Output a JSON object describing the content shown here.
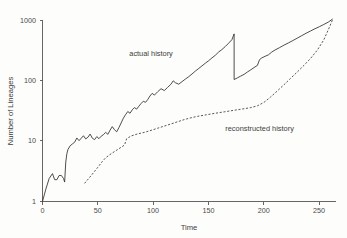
{
  "chart_data": {
    "type": "line",
    "title": "",
    "xlabel": "Time",
    "ylabel": "Number of Lineages",
    "yscale": "log",
    "xlim": [
      0,
      265
    ],
    "ylim": [
      1,
      1300
    ],
    "grid": false,
    "legend_position": "inline-annotations",
    "xticks": [
      0,
      50,
      100,
      150,
      200,
      250
    ],
    "xtick_labels": [
      "0",
      "50",
      "100",
      "150",
      "200",
      "250"
    ],
    "yticks": [
      1,
      10,
      100,
      1000
    ],
    "ytick_labels": [
      "1",
      "10",
      "100",
      "1000"
    ],
    "annotations": [
      {
        "text": "actual history",
        "x": 98,
        "y": 260
      },
      {
        "text": "reconstructed history",
        "x": 196,
        "y": 15
      }
    ],
    "series": [
      {
        "name": "actual history",
        "style": "solid",
        "color": "#2e2e2e",
        "x": [
          0,
          3,
          6,
          9,
          11,
          13,
          15,
          17,
          19,
          20,
          21,
          22,
          23,
          25,
          27,
          29,
          31,
          33,
          35,
          37,
          39,
          41,
          43,
          45,
          47,
          49,
          51,
          53,
          55,
          57,
          59,
          61,
          63,
          65,
          67,
          69,
          71,
          73,
          75,
          77,
          79,
          81,
          83,
          85,
          87,
          89,
          91,
          93,
          95,
          97,
          99,
          101,
          104,
          107,
          110,
          113,
          116,
          118,
          120,
          123,
          126,
          129,
          132,
          135,
          138,
          141,
          144,
          147,
          150,
          153,
          156,
          159,
          162,
          165,
          168,
          171,
          173,
          173,
          176,
          179,
          182,
          185,
          188,
          191,
          194,
          196,
          198,
          201,
          204,
          207,
          210,
          214,
          218,
          222,
          226,
          230,
          234,
          238,
          242,
          246,
          250,
          254,
          258,
          262
        ],
        "y": [
          1,
          1.6,
          2.4,
          2.9,
          2.3,
          2.3,
          2.7,
          2.7,
          2.4,
          2.1,
          4.5,
          6.2,
          7.3,
          8.4,
          9.0,
          9.6,
          11.3,
          10.2,
          11.2,
          12.3,
          10.9,
          11.6,
          13.1,
          11.2,
          10.6,
          11.9,
          11.0,
          12.1,
          12.8,
          14.0,
          13.0,
          15.2,
          17.4,
          15.5,
          14.3,
          16.8,
          20.0,
          24.0,
          27.5,
          31.0,
          29.0,
          33.0,
          36.0,
          34.0,
          38.0,
          42.0,
          46.0,
          44.0,
          49.0,
          56.0,
          62.0,
          58.0,
          66.0,
          74.0,
          69.0,
          78.0,
          88.0,
          100.0,
          93.0,
          88.0,
          97.0,
          107.0,
          117.0,
          130.0,
          145.0,
          160.0,
          177.0,
          196.0,
          215.0,
          240.0,
          265.0,
          300.0,
          330.0,
          370.0,
          420.0,
          480.0,
          600.0,
          105.0,
          112.0,
          120.0,
          128.0,
          140.0,
          152.0,
          166.0,
          180.0,
          225.0,
          240.0,
          255.0,
          270.0,
          300.0,
          325.0,
          355.0,
          390.0,
          425.0,
          465.0,
          510.0,
          560.0,
          615.0,
          670.0,
          730.0,
          790.0,
          860.0,
          940.0,
          1060.0
        ]
      },
      {
        "name": "reconstructed history",
        "style": "dashed",
        "color": "#3a3a3a",
        "x": [
          38,
          44,
          50,
          54,
          57,
          57,
          62,
          68,
          74,
          76,
          80,
          86,
          92,
          98,
          104,
          110,
          116,
          122,
          128,
          134,
          140,
          148,
          156,
          164,
          172,
          180,
          188,
          194,
          200,
          206,
          212,
          218,
          224,
          230,
          236,
          242,
          248,
          254,
          258,
          262
        ],
        "y": [
          2.0,
          2.7,
          3.7,
          4.6,
          5.3,
          5.3,
          6.2,
          7.3,
          8.6,
          11.0,
          12.2,
          13.2,
          14.0,
          15.1,
          16.4,
          17.8,
          19.3,
          21.0,
          22.8,
          24.4,
          25.8,
          27.4,
          29.0,
          30.6,
          32.3,
          34.0,
          36.0,
          38.5,
          44.0,
          54.0,
          68.0,
          86.0,
          110.0,
          140.0,
          180.0,
          235.0,
          320.0,
          480.0,
          700.0,
          1040.0
        ]
      }
    ]
  },
  "axes": {
    "x_title": "Time",
    "y_title": "Number of Lineages"
  }
}
